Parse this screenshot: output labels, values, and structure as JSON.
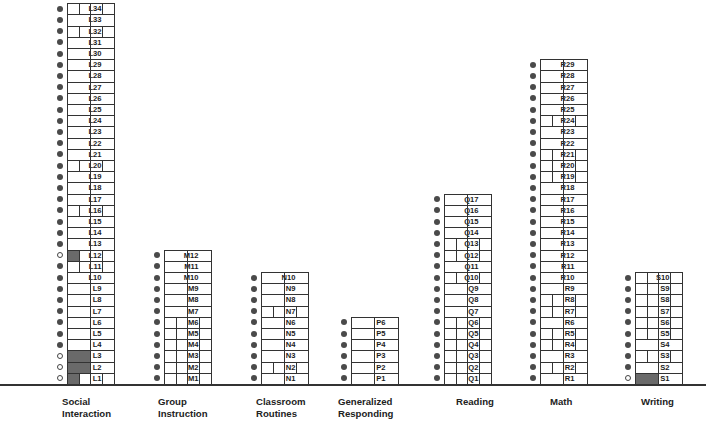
{
  "chart_data": {
    "type": "table",
    "title": "",
    "legend": {
      "filled_circle": "step marker (filled)",
      "open_circle": "step marker (open)",
      "shaded_box": "shaded probe cell"
    },
    "domains": [
      {
        "id": "L",
        "name": "Social Interaction",
        "name_lines": [
          "Social",
          "Interaction"
        ],
        "steps": [
          {
            "label": "L1",
            "circle": "open",
            "cells": 4,
            "shaded": [
              0
            ]
          },
          {
            "label": "L2",
            "circle": "open",
            "cells": 2,
            "shaded": [
              0
            ]
          },
          {
            "label": "L3",
            "circle": "open",
            "cells": 2,
            "shaded": [
              0
            ]
          },
          {
            "label": "L4",
            "circle": "filled",
            "cells": 2,
            "shaded": []
          },
          {
            "label": "L5",
            "circle": "filled",
            "cells": 2,
            "shaded": []
          },
          {
            "label": "L6",
            "circle": "filled",
            "cells": 2,
            "shaded": []
          },
          {
            "label": "L7",
            "circle": "filled",
            "cells": 2,
            "shaded": []
          },
          {
            "label": "L8",
            "circle": "filled",
            "cells": 2,
            "shaded": []
          },
          {
            "label": "L9",
            "circle": "filled",
            "cells": 2,
            "shaded": []
          },
          {
            "label": "L10",
            "circle": "filled",
            "cells": 2,
            "shaded": []
          },
          {
            "label": "L11",
            "circle": "filled",
            "cells": 4,
            "shaded": []
          },
          {
            "label": "L12",
            "circle": "open",
            "cells": 4,
            "shaded": [
              0
            ]
          },
          {
            "label": "L13",
            "circle": "filled",
            "cells": 2,
            "shaded": []
          },
          {
            "label": "L14",
            "circle": "filled",
            "cells": 2,
            "shaded": []
          },
          {
            "label": "L15",
            "circle": "filled",
            "cells": 2,
            "shaded": []
          },
          {
            "label": "L16",
            "circle": "filled",
            "cells": 4,
            "shaded": []
          },
          {
            "label": "L17",
            "circle": "filled",
            "cells": 2,
            "shaded": []
          },
          {
            "label": "L18",
            "circle": "filled",
            "cells": 2,
            "shaded": []
          },
          {
            "label": "L19",
            "circle": "filled",
            "cells": 2,
            "shaded": []
          },
          {
            "label": "L20",
            "circle": "filled",
            "cells": 4,
            "shaded": []
          },
          {
            "label": "L21",
            "circle": "filled",
            "cells": 2,
            "shaded": []
          },
          {
            "label": "L22",
            "circle": "filled",
            "cells": 2,
            "shaded": []
          },
          {
            "label": "L23",
            "circle": "filled",
            "cells": 2,
            "shaded": []
          },
          {
            "label": "L24",
            "circle": "filled",
            "cells": 2,
            "shaded": []
          },
          {
            "label": "L25",
            "circle": "filled",
            "cells": 2,
            "shaded": []
          },
          {
            "label": "L26",
            "circle": "filled",
            "cells": 2,
            "shaded": []
          },
          {
            "label": "L27",
            "circle": "filled",
            "cells": 2,
            "shaded": []
          },
          {
            "label": "L28",
            "circle": "filled",
            "cells": 2,
            "shaded": []
          },
          {
            "label": "L29",
            "circle": "filled",
            "cells": 2,
            "shaded": []
          },
          {
            "label": "L30",
            "circle": "filled",
            "cells": 2,
            "shaded": []
          },
          {
            "label": "L31",
            "circle": "filled",
            "cells": 2,
            "shaded": []
          },
          {
            "label": "L32",
            "circle": "filled",
            "cells": 4,
            "shaded": []
          },
          {
            "label": "L33",
            "circle": "filled",
            "cells": 2,
            "shaded": []
          },
          {
            "label": "L34",
            "circle": "filled",
            "cells": 4,
            "shaded": []
          }
        ]
      },
      {
        "id": "M",
        "name": "Group Instruction",
        "name_lines": [
          "Group",
          "Instruction"
        ],
        "steps": [
          {
            "label": "M1",
            "circle": "filled",
            "cells": 4,
            "shaded": []
          },
          {
            "label": "M2",
            "circle": "filled",
            "cells": 4,
            "shaded": []
          },
          {
            "label": "M3",
            "circle": "filled",
            "cells": 4,
            "shaded": []
          },
          {
            "label": "M4",
            "circle": "filled",
            "cells": 4,
            "shaded": []
          },
          {
            "label": "M5",
            "circle": "filled",
            "cells": 4,
            "shaded": []
          },
          {
            "label": "M6",
            "circle": "filled",
            "cells": 4,
            "shaded": []
          },
          {
            "label": "M7",
            "circle": "filled",
            "cells": 2,
            "shaded": []
          },
          {
            "label": "M8",
            "circle": "filled",
            "cells": 2,
            "shaded": []
          },
          {
            "label": "M9",
            "circle": "filled",
            "cells": 2,
            "shaded": []
          },
          {
            "label": "M10",
            "circle": "filled",
            "cells": 2,
            "shaded": []
          },
          {
            "label": "M11",
            "circle": "filled",
            "cells": 2,
            "shaded": []
          },
          {
            "label": "M12",
            "circle": "filled",
            "cells": 2,
            "shaded": []
          }
        ]
      },
      {
        "id": "N",
        "name": "Classroom Routines",
        "name_lines": [
          "Classroom",
          "Routines"
        ],
        "steps": [
          {
            "label": "N1",
            "circle": "filled",
            "cells": 2,
            "shaded": []
          },
          {
            "label": "N2",
            "circle": "filled",
            "cells": 4,
            "shaded": []
          },
          {
            "label": "N3",
            "circle": "filled",
            "cells": 2,
            "shaded": []
          },
          {
            "label": "N4",
            "circle": "filled",
            "cells": 2,
            "shaded": []
          },
          {
            "label": "N5",
            "circle": "filled",
            "cells": 2,
            "shaded": []
          },
          {
            "label": "N6",
            "circle": "filled",
            "cells": 2,
            "shaded": []
          },
          {
            "label": "N7",
            "circle": "filled",
            "cells": 4,
            "shaded": []
          },
          {
            "label": "N8",
            "circle": "filled",
            "cells": 2,
            "shaded": []
          },
          {
            "label": "N9",
            "circle": "filled",
            "cells": 2,
            "shaded": []
          },
          {
            "label": "N10",
            "circle": "filled",
            "cells": 2,
            "shaded": []
          }
        ]
      },
      {
        "id": "P",
        "name": "Generalized Responding",
        "name_lines": [
          "Generalized",
          "Responding"
        ],
        "steps": [
          {
            "label": "P1",
            "circle": "filled",
            "cells": 2,
            "shaded": []
          },
          {
            "label": "P2",
            "circle": "filled",
            "cells": 2,
            "shaded": []
          },
          {
            "label": "P3",
            "circle": "filled",
            "cells": 2,
            "shaded": []
          },
          {
            "label": "P4",
            "circle": "filled",
            "cells": 2,
            "shaded": []
          },
          {
            "label": "P5",
            "circle": "filled",
            "cells": 2,
            "shaded": []
          },
          {
            "label": "P6",
            "circle": "filled",
            "cells": 2,
            "shaded": []
          }
        ]
      },
      {
        "id": "Q",
        "name": "Reading",
        "name_lines": [
          "Reading"
        ],
        "steps": [
          {
            "label": "Q1",
            "circle": "filled",
            "cells": 4,
            "shaded": []
          },
          {
            "label": "Q2",
            "circle": "filled",
            "cells": 4,
            "shaded": []
          },
          {
            "label": "Q3",
            "circle": "filled",
            "cells": 4,
            "shaded": []
          },
          {
            "label": "Q4",
            "circle": "filled",
            "cells": 4,
            "shaded": []
          },
          {
            "label": "Q5",
            "circle": "filled",
            "cells": 4,
            "shaded": []
          },
          {
            "label": "Q6",
            "circle": "filled",
            "cells": 4,
            "shaded": []
          },
          {
            "label": "Q7",
            "circle": "filled",
            "cells": 2,
            "shaded": []
          },
          {
            "label": "Q8",
            "circle": "filled",
            "cells": 2,
            "shaded": []
          },
          {
            "label": "Q9",
            "circle": "filled",
            "cells": 2,
            "shaded": []
          },
          {
            "label": "Q10",
            "circle": "filled",
            "cells": 4,
            "shaded": []
          },
          {
            "label": "Q11",
            "circle": "filled",
            "cells": 2,
            "shaded": []
          },
          {
            "label": "Q12",
            "circle": "filled",
            "cells": 4,
            "shaded": []
          },
          {
            "label": "Q13",
            "circle": "filled",
            "cells": 4,
            "shaded": []
          },
          {
            "label": "Q14",
            "circle": "filled",
            "cells": 2,
            "shaded": []
          },
          {
            "label": "Q15",
            "circle": "filled",
            "cells": 2,
            "shaded": []
          },
          {
            "label": "Q16",
            "circle": "filled",
            "cells": 2,
            "shaded": []
          },
          {
            "label": "Q17",
            "circle": "filled",
            "cells": 2,
            "shaded": []
          }
        ]
      },
      {
        "id": "R",
        "name": "Math",
        "name_lines": [
          "Math"
        ],
        "steps": [
          {
            "label": "R1",
            "circle": "filled",
            "cells": 2,
            "shaded": []
          },
          {
            "label": "R2",
            "circle": "filled",
            "cells": 4,
            "shaded": []
          },
          {
            "label": "R3",
            "circle": "filled",
            "cells": 2,
            "shaded": []
          },
          {
            "label": "R4",
            "circle": "filled",
            "cells": 4,
            "shaded": []
          },
          {
            "label": "R5",
            "circle": "filled",
            "cells": 4,
            "shaded": []
          },
          {
            "label": "R6",
            "circle": "filled",
            "cells": 2,
            "shaded": []
          },
          {
            "label": "R7",
            "circle": "filled",
            "cells": 4,
            "shaded": []
          },
          {
            "label": "R8",
            "circle": "filled",
            "cells": 4,
            "shaded": []
          },
          {
            "label": "R9",
            "circle": "filled",
            "cells": 2,
            "shaded": []
          },
          {
            "label": "R10",
            "circle": "filled",
            "cells": 2,
            "shaded": []
          },
          {
            "label": "R11",
            "circle": "filled",
            "cells": 2,
            "shaded": []
          },
          {
            "label": "R12",
            "circle": "filled",
            "cells": 2,
            "shaded": []
          },
          {
            "label": "R13",
            "circle": "filled",
            "cells": 2,
            "shaded": []
          },
          {
            "label": "R14",
            "circle": "filled",
            "cells": 2,
            "shaded": []
          },
          {
            "label": "R15",
            "circle": "filled",
            "cells": 2,
            "shaded": []
          },
          {
            "label": "R16",
            "circle": "filled",
            "cells": 2,
            "shaded": []
          },
          {
            "label": "R17",
            "circle": "filled",
            "cells": 2,
            "shaded": []
          },
          {
            "label": "R18",
            "circle": "filled",
            "cells": 2,
            "shaded": []
          },
          {
            "label": "R19",
            "circle": "filled",
            "cells": 4,
            "shaded": []
          },
          {
            "label": "R20",
            "circle": "filled",
            "cells": 4,
            "shaded": []
          },
          {
            "label": "R21",
            "circle": "filled",
            "cells": 4,
            "shaded": []
          },
          {
            "label": "R22",
            "circle": "filled",
            "cells": 2,
            "shaded": []
          },
          {
            "label": "R23",
            "circle": "filled",
            "cells": 2,
            "shaded": []
          },
          {
            "label": "R24",
            "circle": "filled",
            "cells": 4,
            "shaded": []
          },
          {
            "label": "R25",
            "circle": "filled",
            "cells": 2,
            "shaded": []
          },
          {
            "label": "R26",
            "circle": "filled",
            "cells": 2,
            "shaded": []
          },
          {
            "label": "R27",
            "circle": "filled",
            "cells": 2,
            "shaded": []
          },
          {
            "label": "R28",
            "circle": "filled",
            "cells": 2,
            "shaded": []
          },
          {
            "label": "R29",
            "circle": "filled",
            "cells": 2,
            "shaded": []
          }
        ]
      },
      {
        "id": "S",
        "name": "Writing",
        "name_lines": [
          "Writing"
        ],
        "steps": [
          {
            "label": "S1",
            "circle": "open",
            "cells": 2,
            "shaded": [
              0
            ]
          },
          {
            "label": "S2",
            "circle": "filled",
            "cells": 2,
            "shaded": []
          },
          {
            "label": "S3",
            "circle": "filled",
            "cells": 4,
            "shaded": []
          },
          {
            "label": "S4",
            "circle": "filled",
            "cells": 2,
            "shaded": []
          },
          {
            "label": "S5",
            "circle": "filled",
            "cells": 4,
            "shaded": []
          },
          {
            "label": "S6",
            "circle": "filled",
            "cells": 4,
            "shaded": []
          },
          {
            "label": "S7",
            "circle": "filled",
            "cells": 4,
            "shaded": []
          },
          {
            "label": "S8",
            "circle": "filled",
            "cells": 4,
            "shaded": []
          },
          {
            "label": "S9",
            "circle": "filled",
            "cells": 4,
            "shaded": []
          },
          {
            "label": "S10",
            "circle": "filled",
            "cells": 4,
            "shaded": []
          }
        ]
      }
    ],
    "step_counts": {
      "Social Interaction": 34,
      "Group Instruction": 12,
      "Classroom Routines": 10,
      "Generalized Responding": 6,
      "Reading": 17,
      "Math": 29,
      "Writing": 10
    },
    "grid": false,
    "legend_position": "none"
  },
  "colors": {
    "line": "#333333",
    "dot_filled": "#4a4a4a",
    "shade": "#6a6a6a",
    "background": "#ffffff"
  }
}
